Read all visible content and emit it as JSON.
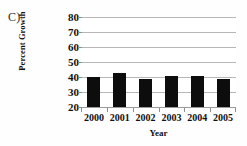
{
  "figure": {
    "panel_label": "C)",
    "background_color": "#ffffff",
    "bar_color": "#0d0d0d",
    "gridline_color": "#b7b7b7",
    "axis_color": "#8f8f8f"
  },
  "chart_data": {
    "type": "bar",
    "title": "",
    "subtitle": "",
    "xlabel": "Year",
    "ylabel": "Percent Growth",
    "categories": [
      "2000",
      "2001",
      "2002",
      "2003",
      "2004",
      "2005"
    ],
    "values": [
      40,
      43,
      39,
      40.5,
      40.5,
      39
    ],
    "series": [
      {
        "name": "Percent Growth",
        "values": [
          40,
          43,
          39,
          40.5,
          40.5,
          39
        ]
      }
    ],
    "ylim": [
      20,
      80
    ],
    "yticks": [
      20,
      30,
      40,
      50,
      60,
      70,
      80
    ],
    "ytick_labels": [
      "20",
      "30",
      "40",
      "50",
      "60",
      "70",
      "80"
    ],
    "grid": true,
    "grid_axis": "y",
    "legend": false,
    "legend_position": "none",
    "annotations": []
  }
}
